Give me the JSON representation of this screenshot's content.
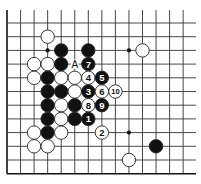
{
  "diagram": {
    "type": "go-board-fragment",
    "corner": "bottom-left",
    "grid": {
      "origin_x": 7,
      "origin_y": 23,
      "spacing_x": 13.55,
      "spacing_y": 13.7,
      "columns": 14,
      "rows": 12,
      "line_top": 10,
      "line_right": 196,
      "line_color": "#333333",
      "edge_color": "#111111"
    },
    "star_points": [
      {
        "col": 3,
        "row": 2
      },
      {
        "col": 9,
        "row": 2
      },
      {
        "col": 9,
        "row": 8
      }
    ],
    "stones": [
      {
        "color": "white",
        "col": 3,
        "row": 1
      },
      {
        "color": "black",
        "col": 4,
        "row": 2
      },
      {
        "color": "black",
        "col": 6,
        "row": 2
      },
      {
        "color": "white",
        "col": 10,
        "row": 2
      },
      {
        "color": "white",
        "col": 2,
        "row": 3
      },
      {
        "color": "white",
        "col": 3,
        "row": 3
      },
      {
        "color": "black",
        "col": 4,
        "row": 3
      },
      {
        "color": "black",
        "col": 6,
        "row": 3,
        "label": "7"
      },
      {
        "color": "white",
        "col": 2,
        "row": 4
      },
      {
        "color": "black",
        "col": 3,
        "row": 4
      },
      {
        "color": "white",
        "col": 4,
        "row": 4
      },
      {
        "color": "white",
        "col": 5,
        "row": 4
      },
      {
        "color": "white",
        "col": 6,
        "row": 4,
        "label": "4"
      },
      {
        "color": "black",
        "col": 7,
        "row": 4,
        "label": "5"
      },
      {
        "color": "black",
        "col": 3,
        "row": 5
      },
      {
        "color": "black",
        "col": 4,
        "row": 5
      },
      {
        "color": "white",
        "col": 5,
        "row": 5
      },
      {
        "color": "black",
        "col": 6,
        "row": 5,
        "label": "3"
      },
      {
        "color": "white",
        "col": 7,
        "row": 5,
        "label": "6"
      },
      {
        "color": "white",
        "col": 8,
        "row": 5,
        "label": "10"
      },
      {
        "color": "black",
        "col": 3,
        "row": 6
      },
      {
        "color": "white",
        "col": 4,
        "row": 6
      },
      {
        "color": "black",
        "col": 5,
        "row": 6
      },
      {
        "color": "white",
        "col": 6,
        "row": 6,
        "label": "8"
      },
      {
        "color": "black",
        "col": 7,
        "row": 6,
        "label": "9"
      },
      {
        "color": "black",
        "col": 3,
        "row": 7
      },
      {
        "color": "white",
        "col": 4,
        "row": 7
      },
      {
        "color": "black",
        "col": 5,
        "row": 7
      },
      {
        "color": "black",
        "col": 6,
        "row": 7,
        "label": "1"
      },
      {
        "color": "white",
        "col": 2,
        "row": 8
      },
      {
        "color": "black",
        "col": 3,
        "row": 8
      },
      {
        "color": "white",
        "col": 4,
        "row": 8
      },
      {
        "color": "white",
        "col": 7,
        "row": 8,
        "label": "2"
      },
      {
        "color": "white",
        "col": 2,
        "row": 9
      },
      {
        "color": "white",
        "col": 3,
        "row": 9
      },
      {
        "color": "black",
        "col": 11,
        "row": 9
      },
      {
        "color": "white",
        "col": 9,
        "row": 10
      }
    ],
    "annotations": [
      {
        "text": "A",
        "col": 5,
        "row": 3
      }
    ],
    "colors": {
      "black_stone": "#111111",
      "white_stone": "#ffffff",
      "stone_outline": "#222222",
      "background": "#ffffff"
    }
  }
}
